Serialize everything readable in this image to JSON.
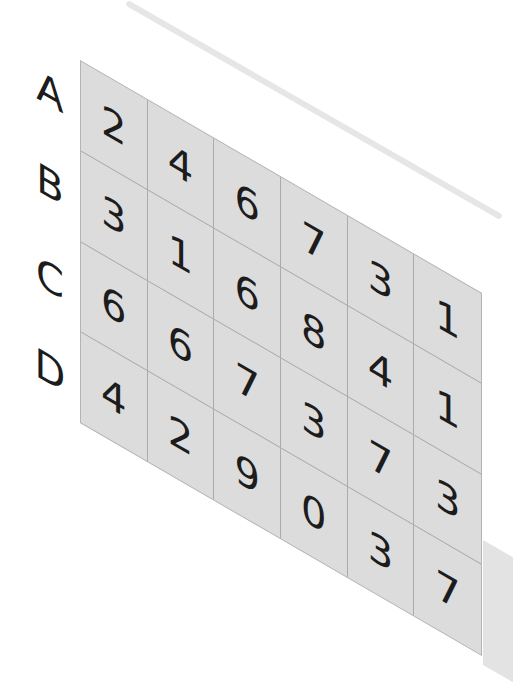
{
  "colors": {
    "cell_fill": "#dcdcdc",
    "grid_line": "#a8a8a8",
    "text": "#1c1c1c",
    "background": "#ffffff"
  },
  "grid": {
    "row_labels": [
      "A",
      "B",
      "C",
      "D"
    ],
    "columns": 6,
    "rows": [
      {
        "label": "A",
        "values": [
          "2",
          "4",
          "6",
          "7",
          "3",
          "1"
        ]
      },
      {
        "label": "B",
        "values": [
          "3",
          "1",
          "6",
          "8",
          "4",
          "1"
        ]
      },
      {
        "label": "C",
        "values": [
          "6",
          "6",
          "7",
          "3",
          "7",
          "3"
        ]
      },
      {
        "label": "D",
        "values": [
          "4",
          "2",
          "9",
          "0",
          "3",
          "7"
        ]
      }
    ]
  }
}
